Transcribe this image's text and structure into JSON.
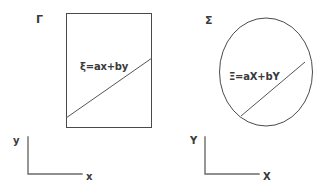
{
  "figure": {
    "background_color": "#ffffff",
    "stroke_color": "#4a4a4a",
    "text_color": "#3a3a3a"
  },
  "panels": [
    {
      "id": "left",
      "label": "Γ",
      "label_name": "gamma",
      "shape": "rectangle",
      "equation": "ξ=ax+by",
      "axes": {
        "x_label": "x",
        "y_label": "y"
      }
    },
    {
      "id": "right",
      "label": "Σ",
      "label_name": "sigma",
      "shape": "ellipse",
      "equation": "Ξ=aX+bY",
      "axes": {
        "x_label": "X",
        "y_label": "Y"
      }
    }
  ]
}
